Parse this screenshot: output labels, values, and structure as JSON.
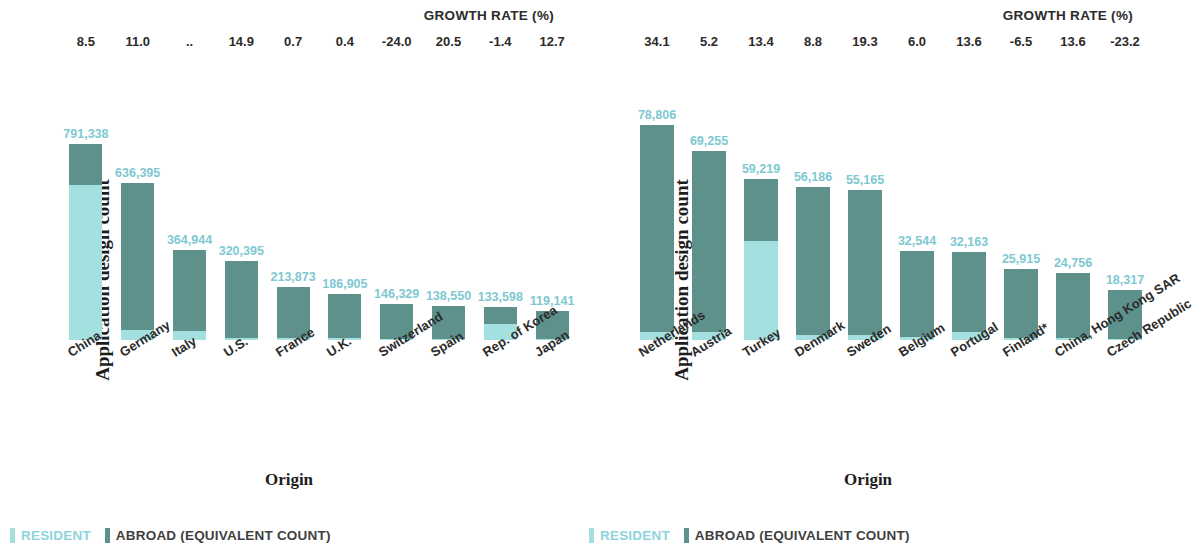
{
  "colors": {
    "resident": "#a5e0e0",
    "abroad": "#5e918c",
    "value_label": "#7ec8d2",
    "text": "#2b2b2b"
  },
  "legend": {
    "resident": "RESIDENT",
    "abroad": "ABROAD (EQUIVALENT COUNT)"
  },
  "axis": {
    "y_title": "Application design count",
    "x_title": "Origin",
    "growth_header": "GROWTH RATE (%)"
  },
  "chart_data": [
    {
      "type": "bar",
      "stacked": true,
      "panel": "left",
      "title": "",
      "xlabel": "Origin",
      "ylabel": "Application design count",
      "ylim": [
        0,
        800000
      ],
      "grid": false,
      "legend_position": "bottom-left",
      "categories": [
        "China",
        "Germany",
        "Italy",
        "U.S.",
        "France",
        "U.K.",
        "Switzerland",
        "Spain",
        "Rep. of Korea",
        "Japan"
      ],
      "totals": [
        "791,338",
        "636,395",
        "364,944",
        "320,395",
        "213,873",
        "186,905",
        "146,329",
        "138,550",
        "133,598",
        "119,141"
      ],
      "totals_numeric": [
        791338,
        636395,
        364944,
        320395,
        213873,
        186905,
        146329,
        138550,
        133598,
        119141
      ],
      "growth_rates": [
        "8.5",
        "11.0",
        "..",
        "14.9",
        "0.7",
        "0.4",
        "-24.0",
        "20.5",
        "-1.4",
        "12.7"
      ],
      "series": [
        {
          "name": "RESIDENT",
          "values": [
            627000,
            40000,
            36000,
            10000,
            8000,
            7000,
            6000,
            6000,
            64000,
            6000
          ]
        },
        {
          "name": "ABROAD (EQUIVALENT COUNT)",
          "values": [
            164338,
            596395,
            328944,
            310395,
            205873,
            179905,
            140329,
            132550,
            69598,
            113141
          ]
        }
      ]
    },
    {
      "type": "bar",
      "stacked": true,
      "panel": "right",
      "title": "",
      "xlabel": "Origin",
      "ylabel": "Application design count",
      "ylim": [
        0,
        80000
      ],
      "grid": false,
      "legend_position": "bottom-left",
      "categories": [
        "Netherlands",
        "Austria",
        "Turkey",
        "Denmark",
        "Sweden",
        "Belgium",
        "Portugal",
        "Finland*",
        "China, Hong Kong SAR",
        "Czech Republic"
      ],
      "totals": [
        "78,806",
        "69,255",
        "59,219",
        "56,186",
        "55,165",
        "32,544",
        "32,163",
        "25,915",
        "24,756",
        "18,317"
      ],
      "totals_numeric": [
        78806,
        69255,
        59219,
        56186,
        55165,
        32544,
        32163,
        25915,
        24756,
        18317
      ],
      "growth_rates": [
        "34.1",
        "5.2",
        "13.4",
        "8.8",
        "19.3",
        "6.0",
        "13.6",
        "-6.5",
        "13.6",
        "-23.2"
      ],
      "series": [
        {
          "name": "RESIDENT",
          "values": [
            3100,
            3100,
            36300,
            1700,
            1900,
            1100,
            2800,
            700,
            600,
            500
          ]
        },
        {
          "name": "ABROAD (EQUIVALENT COUNT)",
          "values": [
            75706,
            66155,
            22919,
            54486,
            53265,
            31444,
            29363,
            25215,
            24156,
            17817
          ]
        }
      ]
    }
  ]
}
